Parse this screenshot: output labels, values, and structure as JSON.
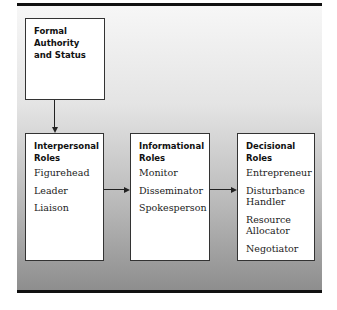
{
  "diagram": {
    "source_box": {
      "title": "Formal Authority and Status"
    },
    "role_boxes": [
      {
        "title": "Interpersonal Roles",
        "items": [
          "Figurehead",
          "Leader",
          "Liaison"
        ]
      },
      {
        "title": "Informational Roles",
        "items": [
          "Monitor",
          "Disseminator",
          "Spokesperson"
        ]
      },
      {
        "title": "Decisional Roles",
        "items": [
          "Entrepreneur",
          "Disturbance Handler",
          "Resource Allocator",
          "Negotiator"
        ]
      }
    ],
    "colors": {
      "rule": "#111111",
      "box_border": "#333333",
      "background_top": "#f7f7f7",
      "background_bottom": "#8e8e8e"
    }
  }
}
